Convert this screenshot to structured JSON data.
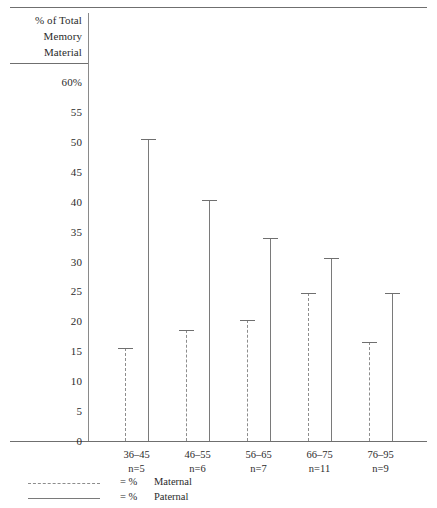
{
  "chart_data": {
    "type": "bar",
    "title": "",
    "ylabel": "% of Total Memory Material",
    "ylabel_lines": [
      "% of Total",
      "Memory",
      "Material"
    ],
    "xlabel": "",
    "ylim": [
      0,
      60
    ],
    "ytick_values": [
      60,
      55,
      50,
      45,
      40,
      35,
      30,
      25,
      20,
      15,
      10,
      5,
      0
    ],
    "ytick_labels": [
      "60%",
      "55",
      "50",
      "45",
      "40",
      "35",
      "30",
      "25",
      "20",
      "15",
      "10",
      "5",
      "0"
    ],
    "grid": false,
    "legend_position": "below-axis-left",
    "categories": [
      "36–45",
      "46–55",
      "56–65",
      "66–75",
      "76–95"
    ],
    "category_counts": [
      "n=5",
      "n=6",
      "n=7",
      "n=11",
      "n=9"
    ],
    "series": [
      {
        "name": "% Maternal",
        "style": "dashed",
        "color": "#8d8d8d",
        "values": [
          15.5,
          18.5,
          20.3,
          24.7,
          16.5
        ]
      },
      {
        "name": "% Paternal",
        "style": "solid",
        "color": "#7a7a7a",
        "values": [
          50.5,
          40.3,
          34.0,
          30.6,
          24.8
        ]
      }
    ]
  },
  "legend": {
    "rows": [
      {
        "equals": "= %",
        "label": "Maternal",
        "style": "dashed"
      },
      {
        "equals": "= %",
        "label": "Paternal",
        "style": "solid"
      }
    ]
  },
  "colors": {
    "rule": "#6f6f6f",
    "axis": "#8a8a8a",
    "maternal": "#8d8d8d",
    "paternal": "#7a7a7a",
    "text": "#2b2b2b",
    "background": "#ffffff"
  }
}
